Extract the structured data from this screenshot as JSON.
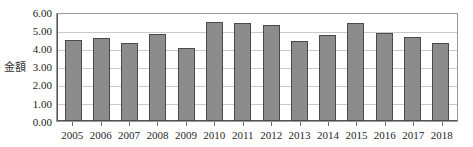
{
  "chart_data": {
    "type": "bar",
    "title": "",
    "subtitle": "",
    "xlabel": "",
    "ylabel": "金額",
    "categories": [
      "2005",
      "2006",
      "2007",
      "2008",
      "2009",
      "2010",
      "2011",
      "2012",
      "2013",
      "2014",
      "2015",
      "2016",
      "2017",
      "2018"
    ],
    "values": [
      4.48,
      4.55,
      4.32,
      4.8,
      4.0,
      5.47,
      5.41,
      5.27,
      4.43,
      4.75,
      5.37,
      4.82,
      4.65,
      4.3
    ],
    "ylim": [
      0.0,
      6.0
    ],
    "ytick_labels": [
      "6.00",
      "5.00",
      "4.00",
      "3.00",
      "2.00",
      "1.00",
      "0.00"
    ],
    "ytick_values": [
      6.0,
      5.0,
      4.0,
      3.0,
      2.0,
      1.0,
      0.0
    ],
    "grid": true,
    "legend": false,
    "legend_position": "none",
    "series": [
      {
        "name": "金額",
        "values": [
          4.48,
          4.55,
          4.32,
          4.8,
          4.0,
          5.47,
          5.41,
          5.27,
          4.43,
          4.75,
          5.37,
          4.82,
          4.65,
          4.3
        ]
      }
    ]
  },
  "colors": {
    "bar_fill": "#8c8c8c",
    "bar_border": "#4a4a4a",
    "gridline": "#c9c9c9",
    "axis": "#555555",
    "plot_border": "#9a9a9a",
    "text": "#1f1f1f",
    "background": "#ffffff"
  }
}
